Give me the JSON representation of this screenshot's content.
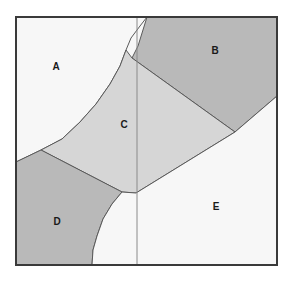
{
  "figure": {
    "type": "region-partition-diagram",
    "width": 291,
    "height": 282,
    "background": "#ffffff",
    "frame": {
      "x": 16,
      "y": 17,
      "width": 261,
      "height": 248,
      "stroke": "#3a3a3a",
      "stroke_width": 2,
      "fill": "#f7f7f7"
    },
    "colors": {
      "white_region": "#f7f7f7",
      "light_gray_region": "#d6d6d6",
      "medium_gray_region": "#b9b9b9",
      "outline": "#5a5a5a",
      "frame_stroke": "#3a3a3a",
      "label_text": "#1a1a1a",
      "divider_line": "#8a8a8a"
    },
    "divider": {
      "orientation": "vertical",
      "x": 137,
      "y1": 17,
      "y2": 265,
      "stroke": "#8a8a8a",
      "stroke_width": 1
    },
    "regions": [
      {
        "id": "A",
        "label": "A",
        "fill": "#f7f7f7",
        "label_x": 56,
        "label_y": 67,
        "points": "16,17 147,17 140,26 131,38 126,50 120,66 110,84 96,104 80,122 62,139 41,150 16,162"
      },
      {
        "id": "B",
        "label": "B",
        "fill": "#b9b9b9",
        "label_x": 215,
        "label_y": 51,
        "points": "147,17 277,17 277,96 235,132 132,58 138,46"
      },
      {
        "id": "C",
        "label": "C",
        "fill": "#d6d6d6",
        "label_x": 124,
        "label_y": 125,
        "points": "132,58 235,132 136,193 122,192 41,150 62,139 80,122 96,104 110,84 120,66 126,50"
      },
      {
        "id": "D",
        "label": "D",
        "fill": "#b9b9b9",
        "label_x": 57,
        "label_y": 222,
        "points": "16,162 41,150 122,192 112,204 103,219 97,236 93,250 92,265 16,265"
      },
      {
        "id": "E",
        "label": "E",
        "fill": "#f7f7f7",
        "label_x": 216,
        "label_y": 207,
        "points": "277,96 277,265 92,265 93,250 97,236 103,219 112,204 122,192 136,193 235,132"
      }
    ]
  }
}
